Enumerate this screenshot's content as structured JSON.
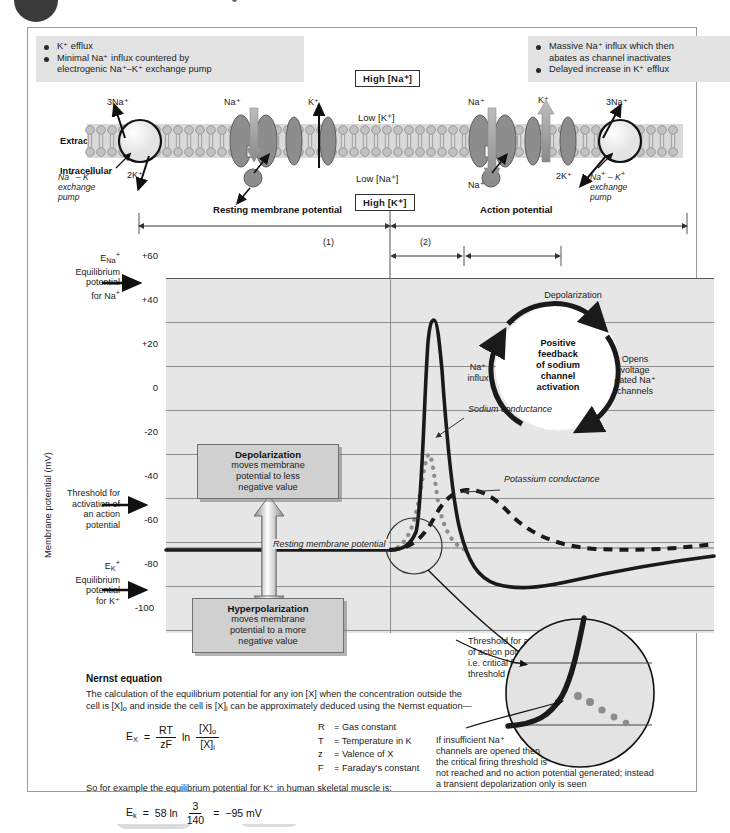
{
  "callouts": {
    "left": [
      "K⁺ efflux",
      "Minimal Na⁺ influx countered by",
      "electrogenic Na⁺–K⁺ exchange pump"
    ],
    "right": [
      "Massive Na⁺ influx which then",
      "abates as channel inactivates",
      "Delayed increase in K⁺ efflux"
    ]
  },
  "membrane": {
    "extracellular": "Extracellular",
    "intracellular": "Intracellular",
    "high_na": "High [Na⁺]",
    "low_k": "Low [K⁺]",
    "low_na": "Low [Na⁺]",
    "high_k": "High [K⁺]",
    "ions": {
      "na3_left": "3Na⁺",
      "k2_left": "2K⁺",
      "na_mid": "Na⁺",
      "k_mid": "K⁺",
      "na_right_top": "Na⁺",
      "k_right": "K⁺",
      "na_right_bottom": "Na⁺",
      "na3_right": "3Na⁺",
      "k2_right": "2K⁺"
    },
    "pump_left": "Na⁺ – K⁺\nexchange\npump",
    "pump_right": "Na⁺ – K⁺\nexchange\npump"
  },
  "phases": {
    "resting": "Resting membrane potential",
    "action": "Action potential",
    "phase1": "(1)",
    "phase2": "(2)"
  },
  "chart_data": {
    "type": "line",
    "xlabel": "",
    "ylabel": "Membrane potential (mV)",
    "ylim": [
      -100,
      60
    ],
    "yticks": [
      "+60",
      "+40",
      "+20",
      "0",
      "-20",
      "-40",
      "-60",
      "-80",
      "-100"
    ],
    "grid": true,
    "legend": [
      "Sodium conductance",
      "Potassium conductance",
      "Resting membrane potential"
    ],
    "series": [
      {
        "name": "Membrane potential",
        "style": "solid",
        "x": [
          0,
          28,
          42,
          46,
          48,
          50,
          52,
          54,
          55,
          56,
          57,
          58,
          59,
          60,
          62,
          65,
          68,
          72,
          78,
          85,
          92,
          100
        ],
        "values": [
          -62,
          -62,
          -60,
          -55,
          -40,
          0,
          30,
          46,
          47,
          40,
          20,
          0,
          -20,
          -40,
          -58,
          -70,
          -74,
          -74,
          -72,
          -69,
          -66,
          -63
        ]
      },
      {
        "name": "Sodium conductance",
        "style": "dotted",
        "x": [
          42,
          48,
          52,
          55,
          57,
          59,
          62,
          66,
          70
        ],
        "values": [
          -62,
          -45,
          -18,
          -4,
          -12,
          -30,
          -50,
          -60,
          -62
        ]
      },
      {
        "name": "Potassium conductance",
        "style": "dashed",
        "x": [
          42,
          50,
          56,
          60,
          64,
          68,
          74,
          82,
          92,
          100
        ],
        "values": [
          -62,
          -58,
          -48,
          -38,
          -38,
          -44,
          -52,
          -58,
          -60,
          -60
        ]
      }
    ],
    "annotations": {
      "resting_line": "Resting membrane potential",
      "resting_value": -62,
      "threshold_value": -50,
      "e_na": 60,
      "e_k": -95
    }
  },
  "axis_notes": {
    "ena": "E_Na⁺\nEquilibrium\npotential\nfor Na⁺",
    "ena_lines": [
      "E",
      "Na",
      "+",
      "Equilibrium",
      "potential",
      "for Na⁺"
    ],
    "threshold": [
      "Threshold for",
      "activation of",
      "an action",
      "potential"
    ],
    "ek": [
      "Equilibrium",
      "potential",
      "for K⁺"
    ]
  },
  "boxes": {
    "depolarization": {
      "title": "Depolarization",
      "lines": [
        "moves membrane",
        "potential to less",
        "negative value"
      ]
    },
    "hyperpolarization": {
      "title": "Hyperpolarization",
      "lines": [
        "moves membrane",
        "potential to a more",
        "negative value"
      ]
    }
  },
  "feedback": {
    "core": [
      "Positive",
      "feedback",
      "of sodium",
      "channel",
      "activation"
    ],
    "top": "Depolarization",
    "right": [
      "Opens",
      "voltage",
      "gated Na⁺",
      "channels"
    ],
    "left": [
      "Na⁺",
      "influx"
    ]
  },
  "curve_labels": {
    "sodium": "Sodium conductance",
    "potassium": "Potassium conductance",
    "resting": "Resting membrane potential"
  },
  "nernst": {
    "heading": "Nernst equation",
    "body": "The calculation of the equilibrium potential for any ion [X] when the concentration outside the cell is [X]o and inside the cell is [X]i can be approximately deduced using the Nernst equation—",
    "eq_lhs": "E",
    "eq_lhs_sub": "X",
    "eq_eq": "=",
    "eq_num1": "RT",
    "eq_den1": "zF",
    "eq_ln": "ln",
    "eq_num2": "[X]",
    "eq_num2_sub": "o",
    "eq_den2": "[X]",
    "eq_den2_sub": "i",
    "legend": [
      {
        "sym": "R",
        "def": "= Gas constant"
      },
      {
        "sym": "T",
        "def": "= Temperature in K"
      },
      {
        "sym": "z",
        "def": "= Valence of X"
      },
      {
        "sym": "F",
        "def": "= Faraday's constant"
      }
    ],
    "example_intro": "So for example the equilibrium potential for K⁺ in human skeletal muscle is:",
    "ex_lhs": "E",
    "ex_lhs_sub": "k",
    "ex_eq": "=",
    "ex_coef": "58 ln",
    "ex_num": "3",
    "ex_den": "140",
    "ex_eq2": "=",
    "ex_result": "−95 mV"
  },
  "inset": {
    "threshold_caption": [
      "Threshold for activation",
      "of action potential",
      "i.e. critical firing",
      "threshold"
    ],
    "bottom_caption": [
      "If insufficient Na⁺",
      "channels are opened then",
      "the critical firing threshold is",
      "not reached and no action potential generated; instead",
      "a transient depolarization only is seen"
    ]
  },
  "colors": {
    "plot_bg": "#e6e6e6",
    "grid": "#8f8f8f",
    "curve": "#1a1a1a",
    "box_fill": "#d0d0d0",
    "callout_bg": "#e3e3e3"
  }
}
